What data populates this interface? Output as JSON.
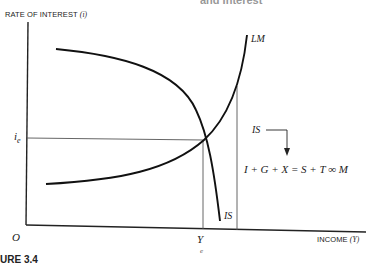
{
  "diagram": {
    "title_cut_top": "and Interest",
    "caption_cut_bottom": "URE 3.4",
    "y_axis": {
      "label": "RATE OF INTEREST",
      "symbol": "(i)"
    },
    "x_axis": {
      "label": "INCOME",
      "symbol": "(Y)"
    },
    "origin_label": "O",
    "equilibrium": {
      "interest_label": "i",
      "interest_sub": "e",
      "income_label": "Y",
      "income_sub": "e"
    },
    "curves": [
      {
        "name": "LM",
        "label": "LM",
        "shape": "upward-sloping"
      },
      {
        "name": "IS",
        "label": "IS",
        "shape": "downward-sloping"
      }
    ],
    "annotation": {
      "pointer_label": "IS",
      "equation": "I + G + X = S + T ∞ M"
    },
    "colors": {
      "curve": "#111111",
      "guide": "#555555",
      "axis": "#222222"
    }
  }
}
